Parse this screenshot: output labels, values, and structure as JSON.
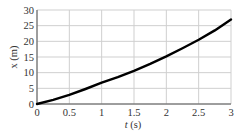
{
  "chart_data": {
    "type": "line",
    "title": "",
    "xlabel_var": "t",
    "xlabel_unit": " (s)",
    "ylabel": "x (m)",
    "xlim": [
      0,
      3
    ],
    "ylim": [
      0,
      30
    ],
    "xticks": [
      0,
      0.5,
      1,
      1.5,
      2,
      2.5,
      3
    ],
    "xtick_labels": [
      "0",
      "0.5",
      "1",
      "1.5",
      "2",
      "2.5",
      "3"
    ],
    "yticks": [
      0,
      5,
      10,
      15,
      20,
      25,
      30
    ],
    "ytick_labels": [
      "0",
      "5",
      "10",
      "15",
      "20",
      "25",
      "30"
    ],
    "grid": true,
    "series": [
      {
        "name": "x(t)",
        "x": [
          0,
          0.25,
          0.5,
          0.75,
          1,
          1.25,
          1.5,
          1.75,
          2,
          2.25,
          2.5,
          2.75,
          3
        ],
        "values": [
          0,
          1.3,
          2.9,
          4.8,
          6.8,
          8.6,
          10.6,
          12.8,
          15.2,
          17.8,
          20.5,
          23.5,
          27
        ]
      }
    ],
    "colors": {
      "line": "#000000",
      "grid": "#cfcfcf",
      "axis": "#555555"
    }
  }
}
